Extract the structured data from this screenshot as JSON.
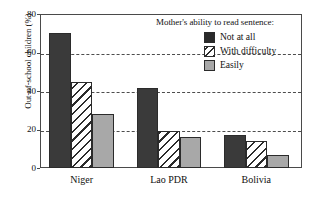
{
  "chart_data": {
    "type": "bar",
    "title": "",
    "xlabel": "",
    "ylabel": "Out-of-school children (%)",
    "categories": [
      "Niger",
      "Lao PDR",
      "Bolivia"
    ],
    "series": [
      {
        "name": "Not at all",
        "values": [
          70,
          41.5,
          17
        ],
        "color": "#3a3a3a",
        "pattern": "solid-dark"
      },
      {
        "name": "With difficulty",
        "values": [
          44.5,
          19,
          14
        ],
        "color": "#ffffff",
        "pattern": "diagonal-hatch"
      },
      {
        "name": "Easily",
        "values": [
          28,
          16,
          7
        ],
        "color": "#a8a8a8",
        "pattern": "solid-gray"
      }
    ],
    "ylim": [
      0,
      80
    ],
    "yticks": [
      0,
      20,
      40,
      60,
      80
    ],
    "ytick_labels": [
      "0",
      "20",
      "40",
      "60",
      "80"
    ],
    "grid": "horizontal-dashed",
    "legend_position": "top-right",
    "legend_title": "Mother's ability to read sentence:"
  },
  "axis": {
    "y_title": "Out-of-school children (%)",
    "y_ticks": [
      {
        "label": "80",
        "value": 80
      },
      {
        "label": "60",
        "value": 60
      },
      {
        "label": "40",
        "value": 40
      },
      {
        "label": "20",
        "value": 20
      },
      {
        "label": "0",
        "value": 0
      }
    ],
    "x_ticks": [
      {
        "label": "Niger"
      },
      {
        "label": "Lao PDR"
      },
      {
        "label": "Bolivia"
      }
    ]
  },
  "legend": {
    "title": "Mother's ability to read sentence:",
    "items": [
      {
        "label": "Not at all"
      },
      {
        "label": "With difficulty"
      },
      {
        "label": "Easily"
      }
    ]
  }
}
